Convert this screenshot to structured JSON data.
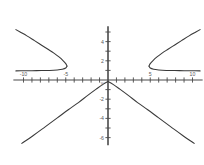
{
  "chart_data": {
    "type": "line",
    "title": "",
    "subtitle": "",
    "xlabel": "",
    "ylabel": "y",
    "xlim": [
      -11.2,
      11.2
    ],
    "ylim": [
      -6.8,
      5.6
    ],
    "grid": false,
    "legend": false,
    "legend_position": "none",
    "background_color": "#ffffff",
    "line_color": "#3a3a3a",
    "axis_color": "#4a4a4a",
    "x_ticks": [
      -10,
      -9,
      -8,
      -7,
      -6,
      -5,
      -4,
      -3,
      -2,
      -1,
      0,
      1,
      2,
      3,
      4,
      5,
      6,
      7,
      8,
      9,
      10
    ],
    "x_tick_labels": [
      {
        "value": -10,
        "text": "-10"
      },
      {
        "value": -5,
        "text": "-5"
      },
      {
        "value": 5,
        "text": "5"
      },
      {
        "value": 10,
        "text": "10"
      }
    ],
    "y_ticks": [
      -6,
      -5,
      -4,
      -3,
      -2,
      -1,
      0,
      1,
      2,
      3,
      4,
      5
    ],
    "y_tick_labels": [
      {
        "value": 4,
        "text": "4"
      },
      {
        "value": 2,
        "text": "2"
      },
      {
        "value": -2,
        "text": "-2"
      },
      {
        "value": -4,
        "text": "-4"
      },
      {
        "value": -6,
        "text": "-6"
      }
    ],
    "series": [
      {
        "name": "right-parabola-upper",
        "description": "Sideways parabola opening right, vertex near (5, 1.5), upper branch rising to (10.8, 5.2)",
        "points": [
          [
            4.85,
            1.45
          ],
          [
            5.0,
            1.7
          ],
          [
            5.3,
            2.0
          ],
          [
            5.8,
            2.4
          ],
          [
            6.4,
            2.8
          ],
          [
            7.1,
            3.2
          ],
          [
            7.9,
            3.65
          ],
          [
            8.7,
            4.1
          ],
          [
            9.6,
            4.6
          ],
          [
            10.4,
            5.0
          ],
          [
            10.9,
            5.25
          ]
        ]
      },
      {
        "name": "right-parabola-lower",
        "description": "Lower branch of right parabola, flattening toward (10.9, 1.0)",
        "points": [
          [
            4.85,
            1.45
          ],
          [
            5.0,
            1.25
          ],
          [
            5.4,
            1.12
          ],
          [
            6.0,
            1.05
          ],
          [
            6.9,
            1.0
          ],
          [
            7.9,
            0.98
          ],
          [
            9.0,
            0.97
          ],
          [
            10.0,
            0.96
          ],
          [
            10.9,
            0.95
          ]
        ]
      },
      {
        "name": "left-parabola-upper",
        "description": "Sideways parabola opening left, vertex near (-5, 1.5), upper branch rising to (-10.8, 5.2)",
        "points": [
          [
            -4.85,
            1.45
          ],
          [
            -5.0,
            1.7
          ],
          [
            -5.3,
            2.0
          ],
          [
            -5.8,
            2.4
          ],
          [
            -6.4,
            2.8
          ],
          [
            -7.1,
            3.2
          ],
          [
            -7.9,
            3.65
          ],
          [
            -8.7,
            4.1
          ],
          [
            -9.6,
            4.6
          ],
          [
            -10.4,
            5.0
          ],
          [
            -10.9,
            5.25
          ]
        ]
      },
      {
        "name": "left-parabola-lower",
        "description": "Lower branch of left parabola, flattening toward (-10.9, 1.0)",
        "points": [
          [
            -4.85,
            1.45
          ],
          [
            -5.0,
            1.25
          ],
          [
            -5.4,
            1.12
          ],
          [
            -6.0,
            1.05
          ],
          [
            -6.9,
            1.0
          ],
          [
            -7.9,
            0.98
          ],
          [
            -9.0,
            0.97
          ],
          [
            -10.0,
            0.96
          ],
          [
            -10.9,
            0.95
          ]
        ]
      },
      {
        "name": "inverted-v-left",
        "description": "Descending branch from apex at origin toward lower-left, slightly concave",
        "points": [
          [
            0,
            -0.15
          ],
          [
            -0.6,
            -0.45
          ],
          [
            -1.4,
            -0.95
          ],
          [
            -2.4,
            -1.6
          ],
          [
            -3.5,
            -2.35
          ],
          [
            -4.7,
            -3.1
          ],
          [
            -6.0,
            -3.95
          ],
          [
            -7.4,
            -4.85
          ],
          [
            -8.8,
            -5.75
          ],
          [
            -10.2,
            -6.6
          ]
        ]
      },
      {
        "name": "inverted-v-right",
        "description": "Descending branch from apex at origin toward lower-right, slightly concave",
        "points": [
          [
            0,
            -0.15
          ],
          [
            0.6,
            -0.45
          ],
          [
            1.4,
            -0.95
          ],
          [
            2.4,
            -1.6
          ],
          [
            3.5,
            -2.35
          ],
          [
            4.7,
            -3.1
          ],
          [
            6.0,
            -3.95
          ],
          [
            7.4,
            -4.85
          ],
          [
            8.8,
            -5.75
          ],
          [
            10.2,
            -6.6
          ]
        ]
      }
    ],
    "annotations": [
      {
        "name": "y-axis-letter",
        "text": "y",
        "x": -0.7,
        "y": -0.55
      }
    ]
  }
}
